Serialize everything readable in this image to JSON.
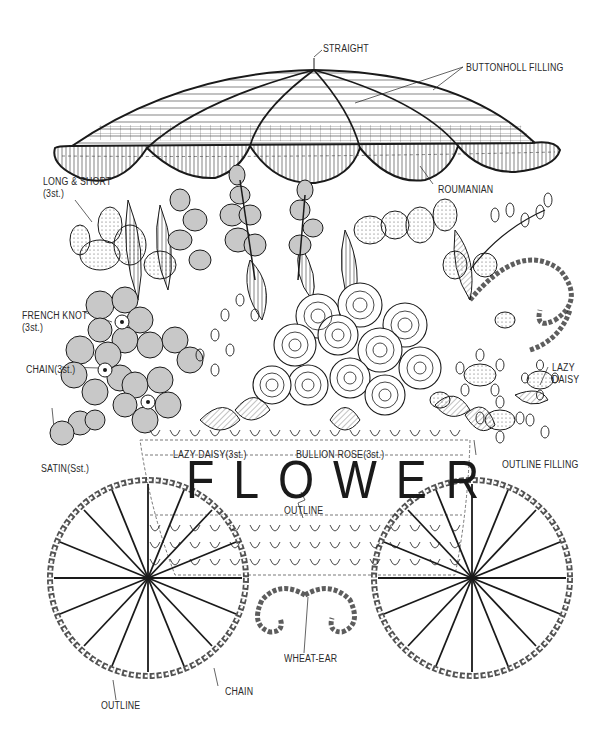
{
  "diagram": {
    "center_word": "FLOWER",
    "line_color": "#1a1a1a",
    "fill_gray": "#c8c8c8",
    "background": "#ffffff"
  },
  "labels": {
    "straight": "STRAIGHT",
    "buttonhole_filling": "BUTTONHOLL  FILLING",
    "long_short": "LONG & SHORT\n(3st.)",
    "roumanian": "ROUMANIAN",
    "french_knot": "FRENCH KNOT\n(3st.)",
    "chain_3st": "CHAIN(3st.)",
    "lazy_daisy_right": "LAZY\nDAISY",
    "satin": "SATIN(Sst.)",
    "lazy_daisy_3st": "LAZY DAISY(3st.)",
    "bullion_rose": "BULLION ROSE(3st.)",
    "outline_filling": "OUTLINE FILLING",
    "outline_center": "OUTLINE",
    "wheat_ear": "WHEAT-EAR",
    "chain_bottom": "CHAIN",
    "outline_bottom": "OUTLINE"
  }
}
